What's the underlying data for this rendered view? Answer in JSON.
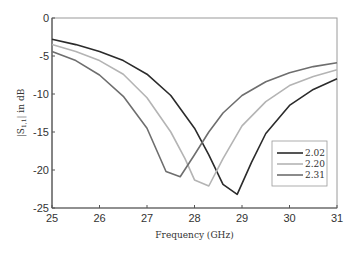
{
  "chart_data": {
    "type": "line",
    "title": "",
    "xlabel": "Frequency (GHz)",
    "ylabel": "|S11| in dB",
    "xlim": [
      25,
      31
    ],
    "ylim": [
      -25,
      0
    ],
    "xticks": [
      25,
      26,
      27,
      28,
      29,
      30,
      31
    ],
    "yticks": [
      0,
      -5,
      -10,
      -15,
      -20,
      -25
    ],
    "grid": false,
    "legend_position": "lower right",
    "series": [
      {
        "name": "2.02",
        "color": "#2b2b2b",
        "x": [
          25,
          25.5,
          26,
          26.5,
          27,
          27.5,
          28,
          28.3,
          28.6,
          28.9,
          29.2,
          29.5,
          30,
          30.5,
          31
        ],
        "y": [
          -2.8,
          -3.5,
          -4.4,
          -5.6,
          -7.4,
          -10.2,
          -14.5,
          -18.0,
          -21.9,
          -23.2,
          -19.0,
          -15.2,
          -11.5,
          -9.4,
          -8.0
        ]
      },
      {
        "name": "2.20",
        "color": "#b4b4b4",
        "x": [
          25,
          25.5,
          26,
          26.5,
          27,
          27.5,
          27.8,
          28.0,
          28.3,
          28.6,
          29,
          29.5,
          30,
          30.5,
          31
        ],
        "y": [
          -3.5,
          -4.4,
          -5.6,
          -7.4,
          -10.5,
          -15.0,
          -18.5,
          -21.3,
          -22.1,
          -18.5,
          -14.2,
          -11.0,
          -8.9,
          -7.7,
          -6.8
        ]
      },
      {
        "name": "2.31",
        "color": "#6e6e6e",
        "x": [
          25,
          25.5,
          26,
          26.5,
          27,
          27.4,
          27.7,
          28.0,
          28.3,
          28.6,
          29,
          29.5,
          30,
          30.5,
          31
        ],
        "y": [
          -4.4,
          -5.6,
          -7.5,
          -10.3,
          -14.5,
          -20.2,
          -20.9,
          -18.0,
          -15.0,
          -12.5,
          -10.2,
          -8.4,
          -7.2,
          -6.4,
          -5.9
        ]
      }
    ]
  },
  "legend": {
    "items": [
      {
        "label": "2.02",
        "color": "#2b2b2b"
      },
      {
        "label": "2.20",
        "color": "#b4b4b4"
      },
      {
        "label": "2.31",
        "color": "#6e6e6e"
      }
    ]
  },
  "axes": {
    "x_title": "Frequency (GHz)",
    "y_title_prefix": "|S",
    "y_title_sub": "1,1",
    "y_title_suffix": "| in dB",
    "x_tick_labels": [
      "25",
      "26",
      "27",
      "28",
      "29",
      "30",
      "31"
    ],
    "y_tick_labels": [
      "0",
      "-5",
      "-10",
      "-15",
      "-20",
      "-25"
    ]
  }
}
